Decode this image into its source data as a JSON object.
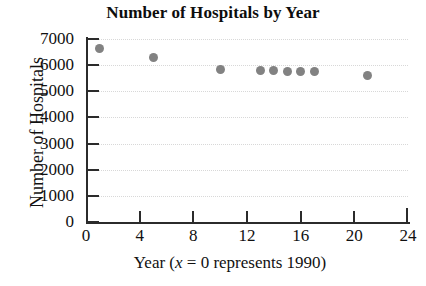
{
  "chart_data": {
    "type": "scatter",
    "title": "Number of Hospitals by Year",
    "xlabel_parts": {
      "before": "Year (",
      "italic": "x",
      "after": " = 0 represents 1990)"
    },
    "xlabel": "Year (x = 0 represents 1990)",
    "ylabel": "Number of Hospitals",
    "xlim": [
      0,
      24
    ],
    "ylim": [
      0,
      7000
    ],
    "xticks": [
      0,
      4,
      8,
      12,
      16,
      20,
      24
    ],
    "xtick_labels": [
      "0",
      "4",
      "8",
      "12",
      "16",
      "20",
      "24"
    ],
    "yticks": [
      0,
      1000,
      2000,
      3000,
      4000,
      5000,
      6000,
      7000
    ],
    "ytick_labels": [
      "0",
      "1000",
      "2000",
      "3000",
      "4000",
      "5000",
      "6000",
      "7000"
    ],
    "grid": "horizontal-dotted",
    "legend": null,
    "marker_color": "#828282",
    "axis_color": "#2b2b2b",
    "grid_color": "#d8d8d8",
    "x": [
      1,
      5,
      10,
      13,
      14,
      15,
      16,
      17,
      21
    ],
    "y": [
      6650,
      6300,
      5840,
      5780,
      5790,
      5770,
      5770,
      5760,
      5620
    ],
    "points": [
      {
        "x": 1,
        "y": 6650
      },
      {
        "x": 5,
        "y": 6300
      },
      {
        "x": 10,
        "y": 5840
      },
      {
        "x": 13,
        "y": 5780
      },
      {
        "x": 14,
        "y": 5790
      },
      {
        "x": 15,
        "y": 5770
      },
      {
        "x": 16,
        "y": 5770
      },
      {
        "x": 17,
        "y": 5760
      },
      {
        "x": 21,
        "y": 5620
      }
    ]
  }
}
